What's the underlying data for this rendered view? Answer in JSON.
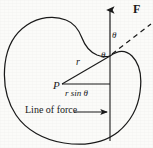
{
  "figure": {
    "kind": "physics-torque-diagram",
    "background_color": "#fbfbf9",
    "ink_color": "#1a1a1a",
    "width": 153,
    "height": 148,
    "labels": {
      "force_vector": "F",
      "angle_upper": "θ",
      "angle_lower": "θ",
      "radius": "r",
      "pivot": "P",
      "moment_arm": "r sin θ",
      "line_of_force": "Line of force"
    },
    "elements": {
      "blob_outline": "closed-irregular-curve",
      "force_line": "vertical-line-with-up-arrow",
      "dashed_line": "dashed-ray-up-right",
      "radius_line": "segment-P-to-vertex",
      "moment_arm_line": "horizontal-segment-with-end-ticks",
      "line_of_force_arrow": "horizontal-arrow-pointing-right"
    },
    "geometry": {
      "pivot_point": [
        62,
        84
      ],
      "vertex_point": [
        110,
        56
      ],
      "force_arrow_tip": [
        110,
        6
      ],
      "force_line_bottom": [
        110,
        140
      ],
      "moment_arm_start": [
        62,
        84
      ],
      "moment_arm_end": [
        110,
        84
      ],
      "dashed_ray_end": [
        150,
        25
      ],
      "lof_arrow_start": [
        70,
        112
      ],
      "lof_arrow_end": [
        110,
        112
      ]
    }
  }
}
